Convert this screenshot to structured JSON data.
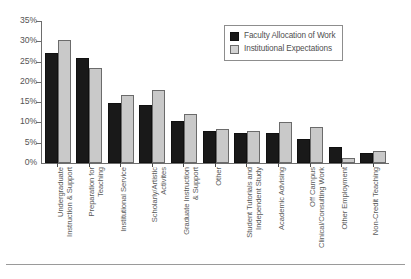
{
  "chart_data": {
    "type": "bar",
    "title": "",
    "xlabel": "",
    "ylabel": "",
    "ylim": [
      0,
      35
    ],
    "ytick_labels": [
      "35%",
      "30%",
      "25%",
      "20%",
      "15%",
      "10%",
      "5%",
      "0%"
    ],
    "ytick_values": [
      35,
      30,
      25,
      20,
      15,
      10,
      5,
      0
    ],
    "grid": false,
    "legend_position": "top-right",
    "categories": [
      "Undergraduate Instruction & Support",
      "Preparation for Teaching",
      "Institutional Service",
      "Scholarly/Artistic Activites",
      "Graduate Instruction & Support",
      "Other",
      "Student Tutorials and Independent Study",
      "Academic Advising",
      "Off Campus Clinical/Consulting Work",
      "Other Employment",
      "Non-Credit Teaching"
    ],
    "category_lines": [
      [
        "Undergraduate",
        "Instruction & Support"
      ],
      [
        "Preparation for",
        "Teaching"
      ],
      [
        "Institutional Service",
        ""
      ],
      [
        "Scholarly/Artistic",
        "Activites"
      ],
      [
        "Graduate Instruction",
        "& Support"
      ],
      [
        "Other",
        ""
      ],
      [
        "Student Tutorials and",
        "Independent Study"
      ],
      [
        "Academic Advising",
        ""
      ],
      [
        "Off Campus",
        "Clinical/Consulting Work"
      ],
      [
        "Other Employment",
        ""
      ],
      [
        "Non-Credit Teaching",
        ""
      ]
    ],
    "series": [
      {
        "name": "Faculty Allocation of Work",
        "color": "#191919",
        "values": [
          27.0,
          26.0,
          14.8,
          14.3,
          10.3,
          8.0,
          7.5,
          7.5,
          6.0,
          4.0,
          2.5
        ]
      },
      {
        "name": "Institutional Expectations",
        "color": "#c9c9c9",
        "values": [
          30.3,
          23.5,
          16.7,
          18.0,
          12.0,
          8.3,
          7.8,
          10.0,
          9.0,
          1.2,
          3.0
        ]
      }
    ]
  }
}
